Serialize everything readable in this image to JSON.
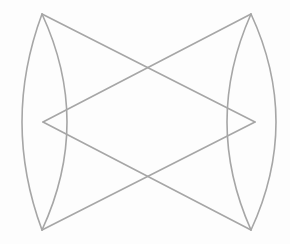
{
  "figure": {
    "stroke_color": "#a6a6a6",
    "stroke_width": 1.6,
    "background": "#fdfdfd",
    "vertices": {
      "top_left": [
        42,
        14
      ],
      "top_right": [
        251,
        14
      ],
      "bottom_left": [
        42,
        230
      ],
      "bottom_right": [
        251,
        230
      ],
      "mid_left": [
        43,
        122
      ],
      "mid_right": [
        255,
        122
      ]
    },
    "lenses": {
      "left": {
        "outer_x_at_mid": 22,
        "inner_x_at_mid": 67
      },
      "right": {
        "inner_x_at_mid": 227,
        "outer_x_at_mid": 276
      }
    },
    "crossings": {
      "upper": [
        146,
        67
      ],
      "lower": [
        146,
        177
      ]
    }
  }
}
